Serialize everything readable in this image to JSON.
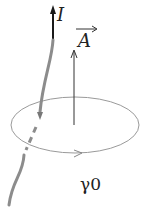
{
  "diagram": {
    "current_label": "I",
    "vector_label": "A",
    "loop_label": "γ0",
    "colors": {
      "wire": "#8c8c8c",
      "wire_head": "#1a1a1a",
      "loop": "#9a9a9a",
      "vector": "#333333",
      "text": "#222222"
    }
  }
}
